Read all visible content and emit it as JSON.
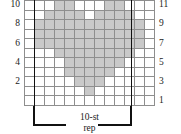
{
  "chart_data": {
    "type": "heatmap",
    "title": "",
    "xlabel": "",
    "ylabel": "",
    "columns": 13,
    "rows": 11,
    "legend": [
      {
        "key": "filled",
        "label": "pattern stitch",
        "color": "#c9c9c9"
      },
      {
        "key": "empty",
        "label": "background stitch",
        "color": "#ffffff"
      }
    ],
    "grid": true,
    "grid_color": "#8e8e8e",
    "repeat": {
      "label_line1": "10-st",
      "label_line2": "rep",
      "stitches": 10,
      "start_column": 2,
      "end_column": 11,
      "color": "#111111"
    },
    "row_labels_left": [
      "10",
      "8",
      "6",
      "4",
      "2"
    ],
    "row_labels_right": [
      "11",
      "9",
      "7",
      "5",
      "3",
      "1"
    ],
    "row_label_rows_left": [
      11,
      9,
      7,
      5,
      3
    ],
    "row_label_rows_right": [
      11,
      9,
      7,
      5,
      3,
      1
    ],
    "cells": [
      [
        0,
        0,
        0,
        1,
        1,
        0,
        0,
        0,
        1,
        1,
        0,
        0,
        0
      ],
      [
        0,
        0,
        1,
        1,
        1,
        1,
        0,
        1,
        1,
        1,
        1,
        0,
        0
      ],
      [
        0,
        1,
        1,
        1,
        1,
        1,
        1,
        1,
        1,
        1,
        1,
        1,
        0
      ],
      [
        0,
        1,
        1,
        1,
        1,
        1,
        1,
        1,
        1,
        1,
        1,
        1,
        0
      ],
      [
        0,
        1,
        1,
        1,
        1,
        1,
        1,
        1,
        1,
        1,
        1,
        1,
        0
      ],
      [
        0,
        0,
        0,
        1,
        1,
        1,
        1,
        1,
        1,
        1,
        1,
        0,
        0
      ],
      [
        0,
        0,
        0,
        0,
        1,
        1,
        1,
        1,
        1,
        1,
        0,
        0,
        0
      ],
      [
        0,
        0,
        0,
        0,
        1,
        1,
        1,
        1,
        1,
        0,
        0,
        0,
        0
      ],
      [
        0,
        0,
        0,
        0,
        0,
        1,
        1,
        1,
        0,
        0,
        0,
        0,
        0
      ],
      [
        0,
        0,
        0,
        0,
        0,
        0,
        1,
        0,
        0,
        0,
        0,
        0,
        0
      ],
      [
        0,
        0,
        0,
        0,
        0,
        0,
        0,
        0,
        0,
        0,
        0,
        0,
        0
      ]
    ]
  },
  "chart": {
    "name": "heart-motif-knitting-chart"
  }
}
